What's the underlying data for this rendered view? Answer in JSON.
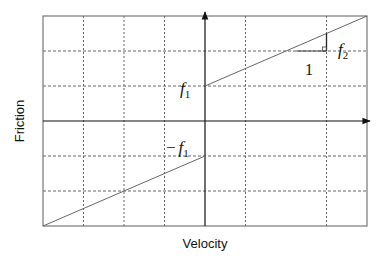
{
  "diagram": {
    "xlabel": "Velocity",
    "ylabel": "Friction",
    "annotations": {
      "f1_positive": {
        "main": "f",
        "sub": "1"
      },
      "f1_negative": {
        "prefix": "−",
        "main": "f",
        "sub": "1"
      },
      "slope_run": "1",
      "slope_rise": {
        "main": "f",
        "sub": "2"
      }
    },
    "colors": {
      "frame": "#777777",
      "grid": "#555555",
      "axis": "#111111",
      "curve": "#666666",
      "text": "#111111"
    }
  },
  "chart_data": {
    "type": "line",
    "title": "",
    "xlabel": "Velocity",
    "ylabel": "Friction",
    "grid": true,
    "xlim": [
      -4,
      4
    ],
    "ylim": [
      -3,
      3
    ],
    "x_gridlines": [
      -3,
      -2,
      -1,
      1,
      3
    ],
    "y_gridlines": [
      -2,
      -1,
      1,
      2
    ],
    "series": [
      {
        "name": "friction-positive-velocity",
        "x": [
          0,
          4
        ],
        "y": [
          1,
          3
        ]
      },
      {
        "name": "friction-negative-velocity",
        "x": [
          -4,
          0
        ],
        "y": [
          -3,
          -1
        ]
      }
    ],
    "slope_triangle": {
      "x_start": 2.25,
      "x_end": 3,
      "y": 2,
      "run": 1,
      "rise_label": "f2"
    }
  }
}
